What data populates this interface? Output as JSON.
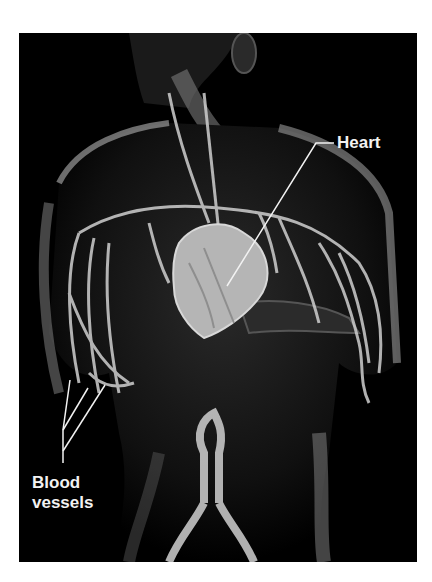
{
  "figure": {
    "labels": {
      "heart": "Heart",
      "blood_vessels_line1": "Blood",
      "blood_vessels_line2": "vessels"
    },
    "colors": {
      "background": "#000000",
      "page": "#ffffff",
      "label": "#f2f2f2",
      "body": "#6e6e6e",
      "vessels": "#cfcfcf",
      "heart": "#b5b5b5"
    }
  }
}
